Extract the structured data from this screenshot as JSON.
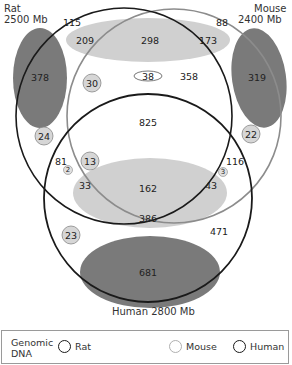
{
  "species": {
    "rat": {
      "name": "Rat",
      "size": "2500 Mb",
      "color": "#1a1a1a"
    },
    "mouse": {
      "name": "Mouse",
      "size": "2400 Mb",
      "color": "#8c8c8c"
    },
    "human": {
      "label": "Human 2800 Mb",
      "color": "#1a1a1a"
    }
  },
  "colors": {
    "light_ellipse": "#d0d0d0",
    "dark_ellipse": "#7a7a7a",
    "small_circle_fill": "#d6d6d6"
  },
  "regions": {
    "rat_only_outer": "115",
    "rat_only_dark": "378",
    "rat_mouse_light_left": "209",
    "rat_mouse_light_center": "298",
    "rat_mouse_light_right": "173",
    "mouse_only_outer": "88",
    "mouse_only_dark": "319",
    "rat_mouse_small_30": "30",
    "rat_mouse_oval_38": "38",
    "rat_mouse_358": "358",
    "all_three_825": "825",
    "rat_small_24": "24",
    "mouse_small_22": "22",
    "rat_human_81": "81",
    "rat_human_small_2": "2",
    "center_small_13": "13",
    "mouse_human_116": "116",
    "mouse_human_small_3": "3",
    "left_33": "33",
    "right_43": "43",
    "human_light_162": "162",
    "human_light_386": "386",
    "human_small_23": "23",
    "human_only_471": "471",
    "human_dark_681": "681"
  },
  "legend": {
    "title_line1": "Genomic",
    "title_line2": "DNA",
    "items": [
      {
        "label": "Rat",
        "color": "#1a1a1a"
      },
      {
        "label": "Mouse",
        "color": "#b0b0b0"
      },
      {
        "label": "Human",
        "color": "#1a1a1a"
      }
    ]
  }
}
